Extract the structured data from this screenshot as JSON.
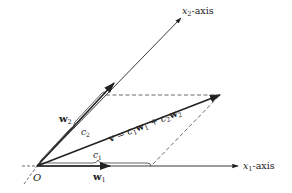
{
  "diagram": {
    "type": "vector-decomposition",
    "origin_label": "O",
    "axes": {
      "x1": {
        "label_var": "x",
        "label_sub": "1",
        "label_suffix": "-axis"
      },
      "x2": {
        "label_var": "x",
        "label_sub": "2",
        "label_suffix": "-axis"
      }
    },
    "vectors": {
      "w1": {
        "label": "w",
        "sub": "1"
      },
      "w2": {
        "label": "w",
        "sub": "2"
      },
      "v": {
        "label": "v",
        "equation_parts": [
          "v",
          " = ",
          "c",
          "1",
          "w",
          "1",
          " + ",
          "c",
          "2",
          "w",
          "2"
        ]
      }
    },
    "braces": {
      "c1": {
        "label": "c",
        "sub": "1"
      },
      "c2": {
        "label": "c",
        "sub": "2"
      }
    },
    "colors": {
      "line": "#222222",
      "dashed": "#444444",
      "background": "#ffffff"
    }
  }
}
